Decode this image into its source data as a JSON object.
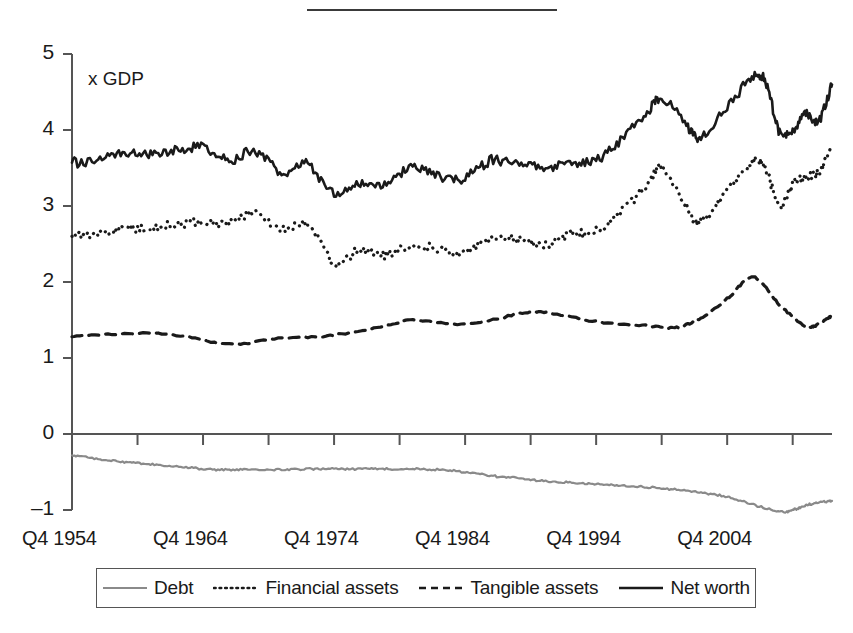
{
  "figure": {
    "units_label": "x GDP",
    "has_top_rule": true
  },
  "chart_data": {
    "type": "line",
    "title": "",
    "subtitle": "",
    "xlabel": "",
    "ylabel": "x GDP",
    "ylim": [
      -1,
      5
    ],
    "xlim": [
      1954.75,
      2012.75
    ],
    "grid": false,
    "legend_position": "bottom",
    "y_ticks": [
      5,
      4,
      3,
      2,
      1,
      0,
      -1
    ],
    "y_tick_labels": [
      "5",
      "4",
      "3",
      "2",
      "1",
      "0",
      "–1"
    ],
    "x_tick_labels": [
      "Q4 1954",
      "Q4 1964",
      "Q4 1974",
      "Q4 1984",
      "Q4 1994",
      "Q4 2004"
    ],
    "x_tick_values": [
      1954.75,
      1964.75,
      1974.75,
      1984.75,
      1994.75,
      2004.75
    ],
    "x_minor_tick_interval_years": 5,
    "colors": {
      "debt": "#8a8a8a",
      "financial_assets": "#1a1a1a",
      "tangible_assets": "#1a1a1a",
      "net_worth": "#1a1a1a"
    },
    "series": [
      {
        "name": "Debt",
        "style": "solid",
        "color": "#8a8a8a",
        "x": [
          1954.75,
          1956.75,
          1958.75,
          1960.75,
          1962.75,
          1964.75,
          1966.75,
          1968.75,
          1970.75,
          1972.75,
          1974.75,
          1976.75,
          1978.75,
          1980.75,
          1982.75,
          1984.75,
          1986.75,
          1988.75,
          1990.75,
          1992.75,
          1994.75,
          1996.75,
          1998.75,
          2000.75,
          2002.75,
          2004.75,
          2006.75,
          2008.75,
          2009.75,
          2010.75,
          2011.75,
          2012.75
        ],
        "values": [
          -0.28,
          -0.33,
          -0.37,
          -0.4,
          -0.43,
          -0.46,
          -0.47,
          -0.47,
          -0.47,
          -0.46,
          -0.46,
          -0.46,
          -0.46,
          -0.46,
          -0.47,
          -0.5,
          -0.55,
          -0.58,
          -0.62,
          -0.64,
          -0.66,
          -0.68,
          -0.7,
          -0.73,
          -0.77,
          -0.83,
          -0.93,
          -1.02,
          -1.0,
          -0.94,
          -0.9,
          -0.88
        ]
      },
      {
        "name": "Financial assets",
        "style": "dotted",
        "color": "#1a1a1a",
        "x": [
          1954.75,
          1956.75,
          1958.75,
          1960.75,
          1962.75,
          1964.75,
          1966.75,
          1968.75,
          1970.75,
          1972.75,
          1974.75,
          1976.75,
          1978.75,
          1980.75,
          1982.75,
          1984.75,
          1986.75,
          1988.75,
          1990.75,
          1992.75,
          1994.75,
          1996.75,
          1998.75,
          1999.75,
          2001.75,
          2002.75,
          2004.75,
          2006.75,
          2007.75,
          2008.75,
          2009.75,
          2010.75,
          2011.75,
          2012.75
        ],
        "values": [
          2.6,
          2.64,
          2.72,
          2.7,
          2.76,
          2.8,
          2.76,
          2.92,
          2.68,
          2.78,
          2.25,
          2.43,
          2.36,
          2.5,
          2.42,
          2.4,
          2.58,
          2.55,
          2.5,
          2.62,
          2.66,
          2.94,
          3.3,
          3.5,
          2.95,
          2.8,
          3.2,
          3.58,
          3.45,
          3.0,
          3.28,
          3.38,
          3.45,
          3.8
        ]
      },
      {
        "name": "Tangible assets",
        "style": "dashed",
        "color": "#1a1a1a",
        "x": [
          1954.75,
          1958.75,
          1962.75,
          1966.75,
          1970.75,
          1974.75,
          1978.75,
          1980.75,
          1984.75,
          1988.75,
          1990.75,
          1994.75,
          1998.75,
          2000.75,
          2002.75,
          2004.75,
          2006.75,
          2008.75,
          2010.75,
          2011.75,
          2012.75
        ],
        "values": [
          1.28,
          1.32,
          1.3,
          1.18,
          1.26,
          1.3,
          1.42,
          1.5,
          1.44,
          1.58,
          1.6,
          1.48,
          1.42,
          1.4,
          1.52,
          1.78,
          2.06,
          1.7,
          1.42,
          1.45,
          1.56
        ]
      },
      {
        "name": "Net worth",
        "style": "solid",
        "color": "#1a1a1a",
        "x": [
          1954.75,
          1956.75,
          1958.75,
          1960.75,
          1962.75,
          1964.75,
          1966.75,
          1968.75,
          1970.75,
          1972.75,
          1974.75,
          1976.75,
          1978.75,
          1980.75,
          1982.75,
          1984.75,
          1986.75,
          1988.75,
          1990.75,
          1992.75,
          1994.75,
          1996.75,
          1998.75,
          1999.75,
          2001.75,
          2002.75,
          2004.75,
          2006.75,
          2007.75,
          2008.75,
          2009.75,
          2010.75,
          2011.75,
          2012.75
        ],
        "values": [
          3.57,
          3.62,
          3.7,
          3.66,
          3.74,
          3.78,
          3.6,
          3.72,
          3.45,
          3.55,
          3.15,
          3.3,
          3.28,
          3.52,
          3.4,
          3.38,
          3.6,
          3.56,
          3.5,
          3.58,
          3.6,
          3.9,
          4.25,
          4.42,
          4.05,
          3.9,
          4.3,
          4.7,
          4.6,
          3.95,
          3.98,
          4.22,
          4.12,
          4.6
        ]
      }
    ]
  },
  "legend": {
    "items": [
      {
        "label": "Debt",
        "style": "solid-gray"
      },
      {
        "label": "Financial assets",
        "style": "dotted"
      },
      {
        "label": "Tangible assets",
        "style": "dashed"
      },
      {
        "label": "Net worth",
        "style": "solid-black"
      }
    ]
  }
}
